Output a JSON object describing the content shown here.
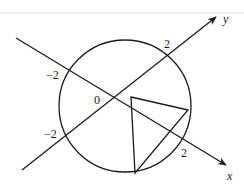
{
  "diagram": {
    "type": "geometry",
    "axes": {
      "x": {
        "label": "x",
        "tick_positive": "2",
        "tick_negative": "−2"
      },
      "y": {
        "label": "y",
        "tick_positive": "2",
        "tick_negative": "−2"
      },
      "origin_label": "0"
    },
    "circle": {
      "radius_label": "2"
    },
    "triangle": {
      "vertices": [
        "interior point",
        "right point on circle",
        "bottom point on circle"
      ]
    },
    "colors": {
      "line": "#1a1a1a",
      "background": "#ffffff"
    }
  }
}
